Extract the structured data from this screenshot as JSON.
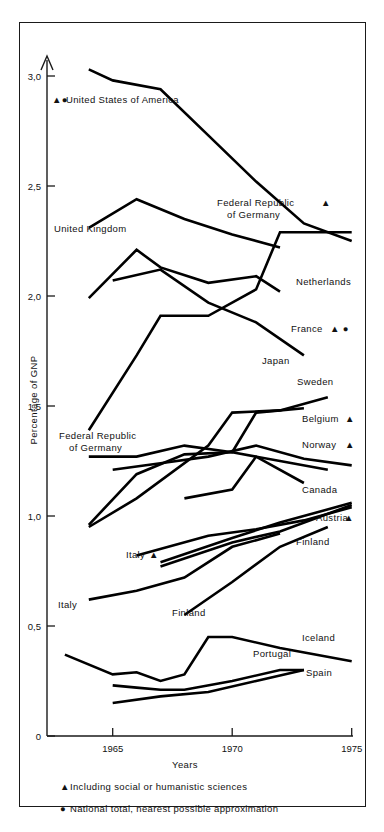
{
  "figure": {
    "axis": {
      "ylabel": "Percentage of GNP",
      "xlabel": "Years",
      "y_ticks": [
        "0",
        "0,5",
        "1,0",
        "1,5",
        "2,0",
        "2,5",
        "3,0"
      ],
      "x_ticks": [
        "1965",
        "1970",
        "1975"
      ]
    },
    "footnotes": [
      {
        "marker": "triangle-marker",
        "glyph": "▲",
        "text": "Including social or humanistic sciences"
      },
      {
        "marker": "circle-marker",
        "glyph": "●",
        "text": "National total, nearest possible approximation"
      }
    ],
    "labels": [
      {
        "name": "label-united-states-of-america",
        "text": "United States of America",
        "markers": "▲●",
        "x": 66,
        "y": 103,
        "marker_x": 52
      },
      {
        "name": "label-united-kingdom",
        "text": "United Kingdom",
        "markers": "",
        "x": 54,
        "y": 232,
        "marker_x": 0
      },
      {
        "name": "label-federal-republic-of-germany-top",
        "text": "Federal Republic",
        "text2": "of Germany",
        "markers": "▲",
        "x": 217,
        "y": 206,
        "marker_x": 321
      },
      {
        "name": "label-netherlands",
        "text": "Netherlands",
        "markers": "",
        "x": 296,
        "y": 285,
        "marker_x": 0
      },
      {
        "name": "label-france",
        "text": "France",
        "markers": "▲  ●",
        "x": 291,
        "y": 332,
        "marker_x": 330
      },
      {
        "name": "label-japan",
        "text": "Japan",
        "markers": "",
        "x": 262,
        "y": 364,
        "marker_x": 0
      },
      {
        "name": "label-sweden",
        "text": "Sweden",
        "markers": "",
        "x": 297,
        "y": 385,
        "marker_x": 0
      },
      {
        "name": "label-belgium",
        "text": "Belgium",
        "markers": "▲",
        "x": 302,
        "y": 422,
        "marker_x": 345
      },
      {
        "name": "label-norway",
        "text": "Norway",
        "markers": "▲",
        "x": 302,
        "y": 448,
        "marker_x": 345
      },
      {
        "name": "label-canada",
        "text": "Canada",
        "markers": "",
        "x": 302,
        "y": 493,
        "marker_x": 0
      },
      {
        "name": "label-austria",
        "text": "Austria",
        "markers": "▲",
        "x": 316,
        "y": 521,
        "marker_x": 344
      },
      {
        "name": "label-finland-right",
        "text": "Finland",
        "markers": "",
        "x": 296,
        "y": 545,
        "marker_x": 0
      },
      {
        "name": "label-federal-republic-of-germany-lower",
        "text": "Federal Republic",
        "text2": "of Germany",
        "markers": "",
        "x": 59,
        "y": 439,
        "marker_x": 0
      },
      {
        "name": "label-italy-upper",
        "text": "Italy",
        "markers": "▲",
        "x": 126,
        "y": 558,
        "marker_x": 149
      },
      {
        "name": "label-italy-lower",
        "text": "Italy",
        "markers": "",
        "x": 58,
        "y": 608,
        "marker_x": 0
      },
      {
        "name": "label-finland-lower",
        "text": "Finland",
        "markers": "",
        "x": 172,
        "y": 616,
        "marker_x": 0
      },
      {
        "name": "label-iceland",
        "text": "Iceland",
        "markers": "",
        "x": 302,
        "y": 641,
        "marker_x": 0
      },
      {
        "name": "label-portugal",
        "text": "Portugal",
        "markers": "",
        "x": 253,
        "y": 657,
        "marker_x": 0
      },
      {
        "name": "label-spain",
        "text": "Spain",
        "markers": "",
        "x": 306,
        "y": 676,
        "marker_x": 0
      }
    ]
  },
  "chart_data": {
    "type": "line",
    "title": "",
    "xlabel": "Years",
    "ylabel": "Percentage of GNP",
    "xlim": [
      1963,
      1975
    ],
    "ylim": [
      0,
      3.1
    ],
    "xticks": [
      1965,
      1970,
      1975
    ],
    "yticks": [
      0,
      0.5,
      1.0,
      1.5,
      2.0,
      2.5,
      3.0
    ],
    "grid": false,
    "legend": "inline-labels",
    "series": [
      {
        "name": "United States of America",
        "footnote_markers": [
          "triangle",
          "circle"
        ],
        "x": [
          1964,
          1965,
          1967,
          1969,
          1971,
          1973,
          1975
        ],
        "y": [
          3.03,
          2.98,
          2.94,
          2.73,
          2.52,
          2.33,
          2.25
        ]
      },
      {
        "name": "United Kingdom",
        "footnote_markers": [],
        "x": [
          1964,
          1966,
          1968,
          1970,
          1972
        ],
        "y": [
          2.31,
          2.44,
          2.35,
          2.28,
          2.22
        ]
      },
      {
        "name": "Federal Republic of Germany",
        "footnote_markers": [
          "triangle"
        ],
        "x": [
          1964,
          1966,
          1967,
          1969,
          1971,
          1972,
          1975
        ],
        "y": [
          1.39,
          1.73,
          1.91,
          1.91,
          2.03,
          2.29,
          2.29
        ]
      },
      {
        "name": "Netherlands",
        "footnote_markers": [],
        "x": [
          1964,
          1966,
          1967,
          1969,
          1971,
          1972
        ],
        "y": [
          1.99,
          2.21,
          2.13,
          2.06,
          2.09,
          2.02
        ]
      },
      {
        "name": "France",
        "footnote_markers": [
          "triangle",
          "circle"
        ],
        "x": [
          1965,
          1967,
          1969,
          1971,
          1973
        ],
        "y": [
          2.07,
          2.12,
          1.97,
          1.88,
          1.73
        ]
      },
      {
        "name": "Japan",
        "footnote_markers": [],
        "x": [
          1964,
          1966,
          1968,
          1970,
          1972,
          1974
        ],
        "y": [
          1.27,
          1.27,
          1.32,
          1.29,
          1.25,
          1.21
        ]
      },
      {
        "name": "Sweden",
        "footnote_markers": [],
        "x": [
          1964,
          1966,
          1969,
          1970,
          1972,
          1974
        ],
        "y": [
          0.95,
          1.08,
          1.32,
          1.47,
          1.48,
          1.54
        ]
      },
      {
        "name": "Belgium",
        "footnote_markers": [
          "triangle"
        ],
        "x": [
          1964,
          1966,
          1968,
          1970,
          1971,
          1973
        ],
        "y": [
          0.96,
          1.19,
          1.28,
          1.29,
          1.47,
          1.49
        ]
      },
      {
        "name": "Norway",
        "footnote_markers": [
          "triangle"
        ],
        "x": [
          1965,
          1967,
          1969,
          1971,
          1973,
          1975
        ],
        "y": [
          1.21,
          1.24,
          1.27,
          1.32,
          1.26,
          1.23
        ]
      },
      {
        "name": "Canada",
        "footnote_markers": [],
        "x": [
          1968,
          1970,
          1971,
          1973
        ],
        "y": [
          1.08,
          1.12,
          1.27,
          1.15
        ]
      },
      {
        "name": "Austria",
        "footnote_markers": [
          "triangle"
        ],
        "x": [
          1967,
          1970,
          1972,
          1975
        ],
        "y": [
          0.79,
          0.9,
          0.97,
          1.06
        ]
      },
      {
        "name": "Finland",
        "footnote_markers": [],
        "x": [
          1967,
          1970,
          1972,
          1975
        ],
        "y": [
          0.77,
          0.88,
          0.93,
          1.05
        ]
      },
      {
        "name": "Italy",
        "footnote_markers": [
          "triangle"
        ],
        "x": [
          1966,
          1969,
          1971,
          1973,
          1975
        ],
        "y": [
          0.82,
          0.91,
          0.94,
          0.98,
          1.04
        ]
      },
      {
        "name": "Italy lower",
        "footnote_markers": [],
        "x": [
          1964,
          1966,
          1968,
          1970,
          1972
        ],
        "y": [
          0.62,
          0.66,
          0.72,
          0.86,
          0.92
        ]
      },
      {
        "name": "Finland lower",
        "footnote_markers": [],
        "x": [
          1968,
          1970,
          1972,
          1974
        ],
        "y": [
          0.55,
          0.7,
          0.86,
          0.95
        ]
      },
      {
        "name": "Iceland",
        "footnote_markers": [],
        "x": [
          1963,
          1965,
          1966,
          1967,
          1968,
          1969,
          1970,
          1972,
          1975
        ],
        "y": [
          0.37,
          0.28,
          0.29,
          0.25,
          0.28,
          0.45,
          0.45,
          0.4,
          0.34
        ]
      },
      {
        "name": "Portugal",
        "footnote_markers": [],
        "x": [
          1965,
          1966,
          1967,
          1968,
          1970,
          1972,
          1973
        ],
        "y": [
          0.23,
          0.22,
          0.21,
          0.21,
          0.25,
          0.3,
          0.3
        ]
      },
      {
        "name": "Spain",
        "footnote_markers": [],
        "x": [
          1965,
          1967,
          1969,
          1971,
          1973
        ],
        "y": [
          0.15,
          0.18,
          0.2,
          0.25,
          0.3
        ]
      }
    ]
  }
}
